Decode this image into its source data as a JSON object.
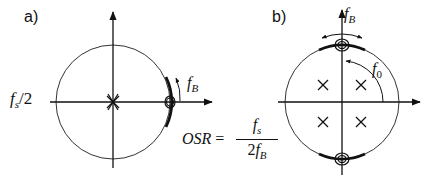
{
  "panel_a": {
    "label": "a)",
    "axis_label_left": {
      "main": "f",
      "sub": "s",
      "rest": "/2"
    },
    "band_label": {
      "main": "f",
      "sub": "B"
    },
    "zeros": "double zero at z = 1",
    "poles": "double pole at origin"
  },
  "panel_b": {
    "label": "b)",
    "band_label": {
      "main": "f",
      "sub": "B"
    },
    "center_label": {
      "main": "f",
      "sub": "0"
    },
    "zeros": "zeros at ±j (f0 = fs/4)",
    "poles": "four poles inside unit circle"
  },
  "formula": {
    "lhs": "OSR",
    "eq": "=",
    "num_main": "f",
    "num_sub": "s",
    "den_pre": "2",
    "den_main": "f",
    "den_sub": "B"
  },
  "colors": {
    "ink": "#111111",
    "background": "#ffffff"
  }
}
